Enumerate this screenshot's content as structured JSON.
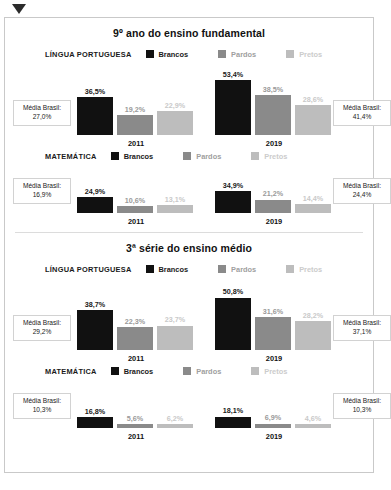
{
  "colors": {
    "brancos": "#111111",
    "pardos": "#8a8a8a",
    "pretos": "#bdbdbd",
    "value_brancos": "#1a1a1a",
    "value_pardos": "#9a9a9a",
    "value_pretos": "#c9c9c9",
    "legend_brancos": "#1a1a1a",
    "legend_pardos": "#a0a0a0",
    "legend_pretos": "#cccccc",
    "frame_border": "#c9c9c9",
    "marker": "#2b2b2b"
  },
  "legend": {
    "brancos": "Brancos",
    "pardos": "Pardos",
    "pretos": "Pretos"
  },
  "avg_label": "Média Brasil:",
  "sections": [
    {
      "title": "9º ano do ensino fundamental",
      "charts": [
        {
          "subject": "LÍNGUA PORTUGUESA",
          "left_avg": "27,0%",
          "right_avg": "41,4%",
          "groups": [
            {
              "year": "2011",
              "values": [
                "36,5%",
                "19,2%",
                "22,9%"
              ]
            },
            {
              "year": "2019",
              "values": [
                "53,4%",
                "38,5%",
                "28,6%"
              ]
            }
          ]
        },
        {
          "subject": "MATEMÁTICA",
          "left_avg": "16,9%",
          "right_avg": "24,4%",
          "groups": [
            {
              "year": "2011",
              "values": [
                "24,9%",
                "10,6%",
                "13,1%"
              ]
            },
            {
              "year": "2019",
              "values": [
                "34,9%",
                "21,2%",
                "14,4%"
              ]
            }
          ]
        }
      ]
    },
    {
      "title": "3ª série do ensino médio",
      "charts": [
        {
          "subject": "LÍNGUA PORTUGUESA",
          "left_avg": "29,2%",
          "right_avg": "37,1%",
          "groups": [
            {
              "year": "2011",
              "values": [
                "38,7%",
                "22,3%",
                "23,7%"
              ]
            },
            {
              "year": "2019",
              "values": [
                "50,8%",
                "31,6%",
                "28,2%"
              ]
            }
          ]
        },
        {
          "subject": "MATEMÁTICA",
          "left_avg": "10,3%",
          "right_avg": "10,3%",
          "groups": [
            {
              "year": "2011",
              "values": [
                "16,8%",
                "5,6%",
                "6,2%"
              ]
            },
            {
              "year": "2019",
              "values": [
                "18,1%",
                "6,9%",
                "4,6%"
              ]
            }
          ]
        }
      ]
    }
  ],
  "caption": "",
  "chart_data": {
    "type": "bar",
    "xlabel": "",
    "ylabel": "",
    "ylim": [
      0,
      60
    ],
    "grid": false,
    "legend_position": "top",
    "categories": [
      "2011",
      "2019"
    ],
    "series_names": [
      "Brancos",
      "Pardos",
      "Pretos"
    ],
    "panels": [
      {
        "panel_title": "9º ano do ensino fundamental",
        "subject": "LÍNGUA PORTUGUESA",
        "categories": [
          "2011",
          "2019"
        ],
        "series": [
          {
            "name": "Brancos",
            "values": [
              36.5,
              53.4
            ]
          },
          {
            "name": "Pardos",
            "values": [
              19.2,
              38.5
            ]
          },
          {
            "name": "Pretos",
            "values": [
              22.9,
              28.6
            ]
          }
        ],
        "annotations": [
          {
            "label": "Média Brasil 2011",
            "value": 27.0
          },
          {
            "label": "Média Brasil 2019",
            "value": 41.4
          }
        ]
      },
      {
        "panel_title": "9º ano do ensino fundamental",
        "subject": "MATEMÁTICA",
        "categories": [
          "2011",
          "2019"
        ],
        "series": [
          {
            "name": "Brancos",
            "values": [
              24.9,
              34.9
            ]
          },
          {
            "name": "Pardos",
            "values": [
              10.6,
              21.2
            ]
          },
          {
            "name": "Pretos",
            "values": [
              13.1,
              14.4
            ]
          }
        ],
        "annotations": [
          {
            "label": "Média Brasil 2011",
            "value": 16.9
          },
          {
            "label": "Média Brasil 2019",
            "value": 24.4
          }
        ]
      },
      {
        "panel_title": "3ª série do ensino médio",
        "subject": "LÍNGUA PORTUGUESA",
        "categories": [
          "2011",
          "2019"
        ],
        "series": [
          {
            "name": "Brancos",
            "values": [
              38.7,
              50.8
            ]
          },
          {
            "name": "Pardos",
            "values": [
              22.3,
              31.6
            ]
          },
          {
            "name": "Pretos",
            "values": [
              23.7,
              28.2
            ]
          }
        ],
        "annotations": [
          {
            "label": "Média Brasil 2011",
            "value": 29.2
          },
          {
            "label": "Média Brasil 2019",
            "value": 37.1
          }
        ]
      },
      {
        "panel_title": "3ª série do ensino médio",
        "subject": "MATEMÁTICA",
        "categories": [
          "2011",
          "2019"
        ],
        "series": [
          {
            "name": "Brancos",
            "values": [
              16.8,
              18.1
            ]
          },
          {
            "name": "Pardos",
            "values": [
              5.6,
              6.9
            ]
          },
          {
            "name": "Pretos",
            "values": [
              6.2,
              4.6
            ]
          }
        ],
        "annotations": [
          {
            "label": "Média Brasil 2011",
            "value": 10.3
          },
          {
            "label": "Média Brasil 2019",
            "value": 10.3
          }
        ]
      }
    ]
  }
}
